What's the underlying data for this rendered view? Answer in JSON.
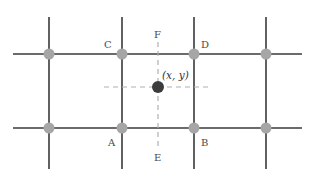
{
  "diagram": {
    "type": "bilinear-interpolation-grid",
    "colors": {
      "grid_line": "#3a3a3a",
      "grid_node": "#a6a6a6",
      "dashed_guide": "#b0b0b0",
      "sample_point": "#3c3c3c",
      "label_text": "#4a4a4a"
    },
    "labels": {
      "A": "A",
      "B": "B",
      "C": "C",
      "D": "D",
      "E": "E",
      "F": "F",
      "point": "(x, y)"
    },
    "grid": {
      "columns": 4,
      "rows": 2
    }
  }
}
